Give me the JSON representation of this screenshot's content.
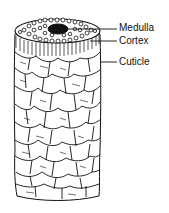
{
  "diagram": {
    "labels": [
      {
        "id": "medulla",
        "text": "Medulla"
      },
      {
        "id": "cortex",
        "text": "Cortex"
      },
      {
        "id": "cuticle",
        "text": "Cuticle"
      }
    ],
    "colors": {
      "ink": "#111111",
      "background": "#ffffff"
    }
  }
}
